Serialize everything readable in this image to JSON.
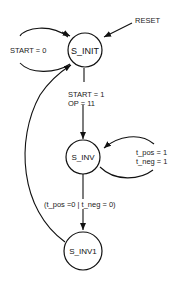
{
  "diagram": {
    "type": "state-machine",
    "states": [
      {
        "id": "S_INIT",
        "label": "S_INIT"
      },
      {
        "id": "S_INV",
        "label": "S_INV"
      },
      {
        "id": "S_INV1",
        "label": "S_INV1"
      }
    ],
    "transitions": [
      {
        "from": "RESET",
        "to": "S_INIT",
        "label": "RESET"
      },
      {
        "from": "S_INIT",
        "to": "S_INIT",
        "label": "START = 0"
      },
      {
        "from": "S_INIT",
        "to": "S_INV",
        "label_line1": "START = 1",
        "label_line2": "OP = 11"
      },
      {
        "from": "S_INV",
        "to": "S_INV",
        "label_line1": "t_pos = 1",
        "label_line2": "t_neg = 1"
      },
      {
        "from": "S_INV",
        "to": "S_INV1",
        "label": "(t_pos =0 | t_neg = 0)"
      },
      {
        "from": "S_INV1",
        "to": "S_INIT",
        "label": ""
      }
    ]
  }
}
